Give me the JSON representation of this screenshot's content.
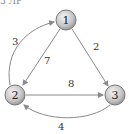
{
  "header": {
    "fragment_text": "5 ЛР"
  },
  "nodes": [
    {
      "id": "1",
      "label": "1",
      "cx": 66,
      "cy": 20
    },
    {
      "id": "2",
      "label": "2",
      "cx": 15,
      "cy": 95
    },
    {
      "id": "3",
      "label": "3",
      "cx": 115,
      "cy": 95
    }
  ],
  "edges": [
    {
      "from": "1",
      "to": "3",
      "weight": "2"
    },
    {
      "from": "1",
      "to": "2",
      "weight": "7"
    },
    {
      "from": "2",
      "to": "1",
      "weight": "3"
    },
    {
      "from": "2",
      "to": "3",
      "weight": "8"
    },
    {
      "from": "3",
      "to": "2",
      "weight": "4"
    }
  ],
  "colors": {
    "edge": "#8a8a8a",
    "node_fill": "#c8c8c8",
    "node_stroke": "#777777"
  }
}
